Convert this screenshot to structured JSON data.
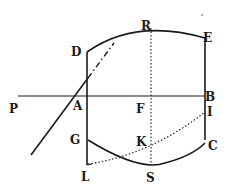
{
  "figure": {
    "labels": {
      "P": "P",
      "A": "A",
      "D": "D",
      "R": "R",
      "E": "E",
      "B": "B",
      "F": "F",
      "I": "I",
      "G": "G",
      "K": "K",
      "C": "C",
      "L": "L",
      "S": "S"
    },
    "colors": {
      "ink": "#1a1a1a",
      "paper": "#ffffff"
    }
  }
}
